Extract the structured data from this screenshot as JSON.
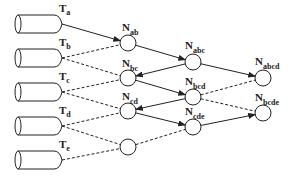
{
  "diagram": {
    "sources": [
      {
        "id": "Ta",
        "label": "T",
        "sub": "a"
      },
      {
        "id": "Tb",
        "label": "T",
        "sub": "b"
      },
      {
        "id": "Tc",
        "label": "T",
        "sub": "c"
      },
      {
        "id": "Td",
        "label": "T",
        "sub": "d"
      },
      {
        "id": "Te",
        "label": "T",
        "sub": "e"
      }
    ],
    "nodes": [
      {
        "id": "Nab",
        "label": "N",
        "sub": "ab",
        "col": 1
      },
      {
        "id": "Nbc",
        "label": "N",
        "sub": "bc",
        "col": 1
      },
      {
        "id": "Ncd",
        "label": "N",
        "sub": "cd",
        "col": 1
      },
      {
        "id": "Nde",
        "label": "",
        "sub": "",
        "col": 1
      },
      {
        "id": "Nabc",
        "label": "N",
        "sub": "abc",
        "col": 2
      },
      {
        "id": "Nbcd",
        "label": "N",
        "sub": "bcd",
        "col": 2
      },
      {
        "id": "Ncde",
        "label": "N",
        "sub": "cde",
        "col": 2
      },
      {
        "id": "Nabcd",
        "label": "N",
        "sub": "abcd",
        "col": 3
      },
      {
        "id": "Nbcde",
        "label": "N",
        "sub": "bcde",
        "col": 3
      }
    ],
    "edges": [
      {
        "from": "Ta",
        "to": "Nab",
        "style": "solid",
        "arrow": true
      },
      {
        "from": "Tb",
        "to": "Nab",
        "style": "dashed",
        "arrow": false
      },
      {
        "from": "Tb",
        "to": "Nbc",
        "style": "dashed",
        "arrow": false
      },
      {
        "from": "Tc",
        "to": "Nbc",
        "style": "dashed",
        "arrow": false
      },
      {
        "from": "Tc",
        "to": "Ncd",
        "style": "dashed",
        "arrow": false
      },
      {
        "from": "Td",
        "to": "Ncd",
        "style": "dashed",
        "arrow": false
      },
      {
        "from": "Td",
        "to": "Nde",
        "style": "dashed",
        "arrow": false
      },
      {
        "from": "Te",
        "to": "Nde",
        "style": "dashed",
        "arrow": false
      },
      {
        "from": "Nab",
        "to": "Nabc",
        "style": "solid",
        "arrow": true
      },
      {
        "from": "Nabc",
        "to": "Nbc",
        "style": "solid",
        "arrow": true
      },
      {
        "from": "Nbc",
        "to": "Nbcd",
        "style": "solid",
        "arrow": true
      },
      {
        "from": "Nbcd",
        "to": "Ncd",
        "style": "solid",
        "arrow": true
      },
      {
        "from": "Ncd",
        "to": "Ncde",
        "style": "solid",
        "arrow": true
      },
      {
        "from": "Nde",
        "to": "Ncde",
        "style": "dashed",
        "arrow": false
      },
      {
        "from": "Nabc",
        "to": "Nabcd",
        "style": "solid",
        "arrow": true
      },
      {
        "from": "Nbcd",
        "to": "Nabcd",
        "style": "dashed",
        "arrow": false
      },
      {
        "from": "Nbcd",
        "to": "Nbcde",
        "style": "dashed",
        "arrow": false
      },
      {
        "from": "Ncde",
        "to": "Nbcde",
        "style": "solid",
        "arrow": true
      }
    ],
    "colors": {
      "stroke": "#222222",
      "background": "#ffffff"
    }
  }
}
